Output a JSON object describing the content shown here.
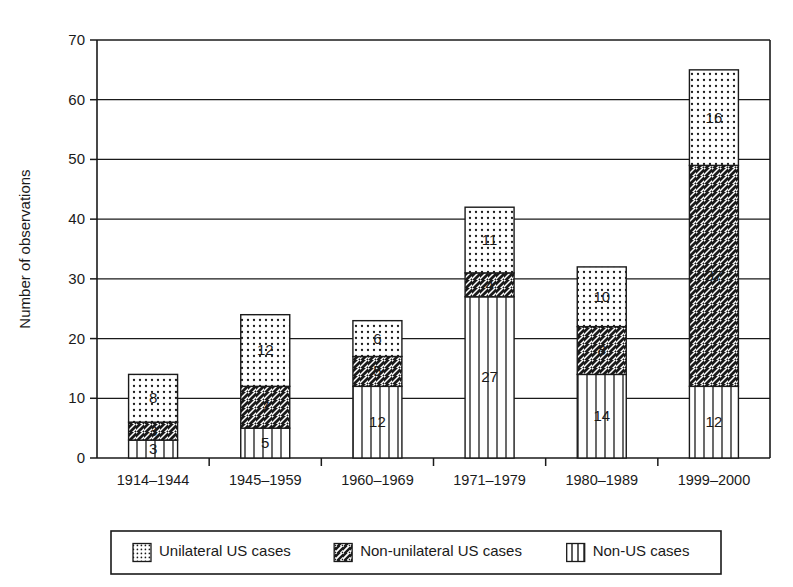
{
  "chart_data": {
    "type": "bar",
    "title": "",
    "subtitle": "",
    "stacked": true,
    "xlabel": "",
    "ylabel": "Number of observations",
    "ylim": [
      0,
      70
    ],
    "ytick_step": 10,
    "yticks": [
      "0",
      "10",
      "20",
      "30",
      "40",
      "50",
      "60",
      "70"
    ],
    "grid": "horizontal",
    "legend_position": "below-plot",
    "categories": [
      "1914–1944",
      "1945–1959",
      "1960–1969",
      "1971–1979",
      "1980–1989",
      "1999–2000"
    ],
    "series": [
      {
        "name": "Non-US cases",
        "pattern": "vertical-lines",
        "order": "bottom",
        "values": [
          3,
          5,
          12,
          27,
          14,
          12
        ]
      },
      {
        "name": "Non-unilateral US cases",
        "pattern": "diagonal-hatch",
        "order": "middle",
        "values": [
          3,
          7,
          5,
          4,
          8,
          37
        ]
      },
      {
        "name": "Unilateral US cases",
        "pattern": "dots",
        "order": "top",
        "values": [
          8,
          12,
          6,
          11,
          10,
          16
        ]
      }
    ],
    "totals": [
      14,
      24,
      23,
      42,
      32,
      65
    ],
    "colors": {
      "ink": "#1a1a1a",
      "background": "#ffffff",
      "pattern_fill": "#ffffff"
    }
  },
  "legend": {
    "entries": [
      {
        "label": "Unilateral US cases",
        "pattern": "dots"
      },
      {
        "label": "Non-unilateral US cases",
        "pattern": "diagonal-hatch"
      },
      {
        "label": "Non-US cases",
        "pattern": "vertical-lines"
      }
    ]
  }
}
